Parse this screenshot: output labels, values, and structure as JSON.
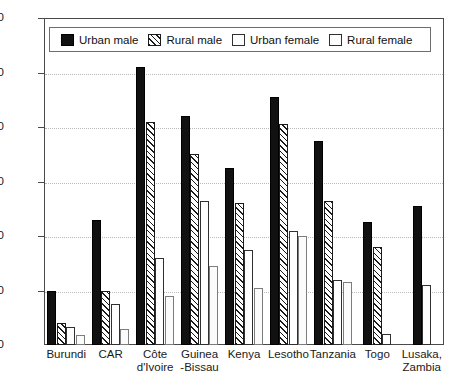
{
  "chart_data": {
    "type": "bar",
    "title": "",
    "subtitle": "",
    "xlabel": "",
    "ylabel": "",
    "ylim": [
      0,
      60
    ],
    "yticks": [
      0,
      10,
      20,
      30,
      40,
      50,
      60
    ],
    "grid": true,
    "legend_position": "top-inside",
    "categories": [
      "Burundi",
      "CAR",
      "Côte d'Ivoire",
      "Guinea -Bissau",
      "Kenya",
      "Lesotho",
      "Tanzania",
      "Togo",
      "Lusaka, Zambia"
    ],
    "category_lines": [
      [
        "Burundi",
        ""
      ],
      [
        "CAR",
        ""
      ],
      [
        "Côte",
        "d'Ivoire"
      ],
      [
        "Guinea",
        "-Bissau"
      ],
      [
        "Kenya",
        ""
      ],
      [
        "Lesotho",
        ""
      ],
      [
        "Tanzania",
        ""
      ],
      [
        "Togo",
        ""
      ],
      [
        "Lusaka,",
        "Zambia"
      ]
    ],
    "series": [
      {
        "name": "Urban male",
        "key": "urban-male",
        "values": [
          10,
          23,
          51,
          42,
          32.5,
          45.5,
          37.5,
          22.5,
          25.5
        ]
      },
      {
        "name": "Rural male",
        "key": "rural-male",
        "values": [
          4,
          10,
          41,
          35,
          26,
          40.5,
          26.5,
          18,
          null
        ]
      },
      {
        "name": "Urban female",
        "key": "urban-female",
        "values": [
          3.3,
          7.5,
          16,
          26.5,
          17.5,
          21,
          12,
          2,
          11
        ]
      },
      {
        "name": "Rural female",
        "key": "rural-female",
        "values": [
          1.8,
          3,
          9,
          14.5,
          10.5,
          20,
          11.5,
          null,
          null
        ]
      }
    ]
  }
}
